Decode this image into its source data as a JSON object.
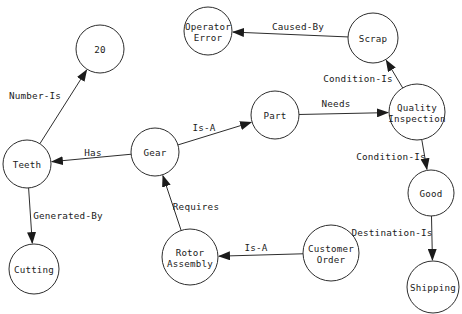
{
  "diagram": {
    "kind": "semantic-network",
    "background_color": "#ffffff",
    "stroke_color": "#2d2d2d",
    "text_color": "#1b1b1b",
    "nodes": [
      {
        "id": "twenty",
        "label": [
          "20"
        ],
        "x": 100,
        "y": 49,
        "r": 24
      },
      {
        "id": "operator-error",
        "label": [
          "Operator",
          "Error"
        ],
        "x": 208,
        "y": 31,
        "r": 24
      },
      {
        "id": "scrap",
        "label": [
          "Scrap"
        ],
        "x": 373,
        "y": 38,
        "r": 25
      },
      {
        "id": "quality-inspection",
        "label": [
          "Quality",
          "Inspection"
        ],
        "x": 417,
        "y": 112,
        "r": 28
      },
      {
        "id": "part",
        "label": [
          "Part"
        ],
        "x": 275,
        "y": 115,
        "r": 24
      },
      {
        "id": "gear",
        "label": [
          "Gear"
        ],
        "x": 155,
        "y": 152,
        "r": 24
      },
      {
        "id": "teeth",
        "label": [
          "Teeth"
        ],
        "x": 27,
        "y": 164,
        "r": 24
      },
      {
        "id": "cutting",
        "label": [
          "Cutting"
        ],
        "x": 34,
        "y": 269,
        "r": 25
      },
      {
        "id": "rotor-assembly",
        "label": [
          "Rotor",
          "Assembly"
        ],
        "x": 190,
        "y": 257,
        "r": 28
      },
      {
        "id": "customer-order",
        "label": [
          "Customer",
          "Order"
        ],
        "x": 331,
        "y": 253,
        "r": 28
      },
      {
        "id": "good",
        "label": [
          "Good"
        ],
        "x": 431,
        "y": 193,
        "r": 23
      },
      {
        "id": "shipping",
        "label": [
          "Shipping"
        ],
        "x": 433,
        "y": 287,
        "r": 26
      }
    ],
    "edges": [
      {
        "from": "teeth",
        "to": "twenty",
        "label": "Number-Is",
        "lx": 35,
        "ly": 95
      },
      {
        "from": "gear",
        "to": "teeth",
        "label": "Has",
        "lx": 93,
        "ly": 152
      },
      {
        "from": "gear",
        "to": "part",
        "label": "Is-A",
        "lx": 204,
        "ly": 127
      },
      {
        "from": "part",
        "to": "quality-inspection",
        "label": "Needs",
        "lx": 336,
        "ly": 103
      },
      {
        "from": "scrap",
        "to": "operator-error",
        "label": "Caused-By",
        "lx": 298,
        "ly": 26
      },
      {
        "from": "quality-inspection",
        "to": "scrap",
        "label": "Condition-Is",
        "lx": 358,
        "ly": 78
      },
      {
        "from": "quality-inspection",
        "to": "good",
        "label": "Condition-Is",
        "lx": 391,
        "ly": 156
      },
      {
        "from": "good",
        "to": "shipping",
        "label": "Destination-Is",
        "lx": 392,
        "ly": 232
      },
      {
        "from": "teeth",
        "to": "cutting",
        "label": "Generated-By",
        "lx": 68,
        "ly": 215
      },
      {
        "from": "rotor-assembly",
        "to": "gear",
        "label": "Requires",
        "lx": 196,
        "ly": 206
      },
      {
        "from": "customer-order",
        "to": "rotor-assembly",
        "label": "Is-A",
        "lx": 256,
        "ly": 247
      }
    ]
  }
}
